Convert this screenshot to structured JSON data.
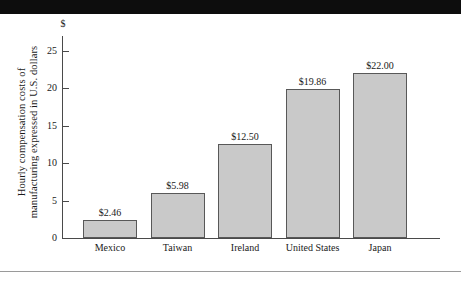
{
  "figure": {
    "currency_symbol": "$",
    "y_axis_title_line1": "Hourly compensation costs of",
    "y_axis_title_line2": "manufacturing expressed in U.S. dollars"
  },
  "chart_data": {
    "type": "bar",
    "title": "",
    "xlabel": "",
    "ylabel": "Hourly compensation costs of manufacturing expressed in U.S. dollars",
    "categories": [
      "Mexico",
      "Taiwan",
      "Ireland",
      "United States",
      "Japan"
    ],
    "values": [
      2.46,
      5.98,
      12.5,
      19.86,
      22.0
    ],
    "value_labels": [
      "$2.46",
      "$5.98",
      "$12.50",
      "$19.86",
      "$22.00"
    ],
    "ylim": [
      0,
      27
    ],
    "yticks": [
      0,
      5,
      10,
      15,
      20,
      25
    ],
    "ytick_labels": [
      "0",
      "5",
      "10",
      "15",
      "20",
      "25"
    ],
    "y_unit_symbol": "$",
    "grid": false,
    "legend": false,
    "bar_fill_color": "#c9c9c9",
    "bar_border_color": "#585858",
    "axis_color": "#4a4a4a"
  }
}
